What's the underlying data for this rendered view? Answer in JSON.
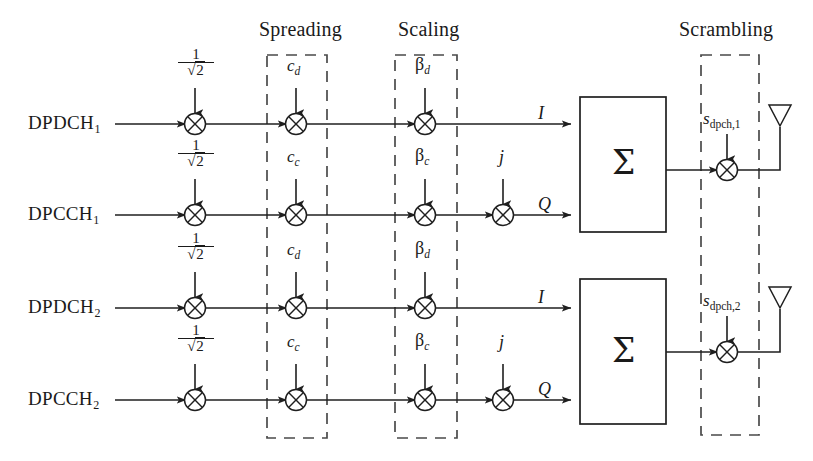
{
  "figure": {
    "line_color": "#1f1f1f",
    "dashed_color": "#4a4a4a",
    "sections": [
      {
        "name": "spreading",
        "label": "Spreading"
      },
      {
        "name": "scaling",
        "label": "Scaling"
      },
      {
        "name": "scrambling",
        "label": "Scrambling"
      }
    ],
    "branches": [
      {
        "input_label": "DPDCH",
        "input_sub": "1",
        "gain_num": "1",
        "gain_den": "2",
        "gain_radical": "√",
        "spread_code": "c",
        "spread_sub": "d",
        "scale_symbol": "β",
        "scale_sub": "d",
        "rail_label": "I",
        "has_j": false,
        "j_label": ""
      },
      {
        "input_label": "DPCCH",
        "input_sub": "1",
        "gain_num": "1",
        "gain_den": "2",
        "gain_radical": "√",
        "spread_code": "c",
        "spread_sub": "c",
        "scale_symbol": "β",
        "scale_sub": "c",
        "rail_label": "Q",
        "has_j": true,
        "j_label": "j"
      },
      {
        "input_label": "DPDCH",
        "input_sub": "2",
        "gain_num": "1",
        "gain_den": "2",
        "gain_radical": "√",
        "spread_code": "c",
        "spread_sub": "d",
        "scale_symbol": "β",
        "scale_sub": "d",
        "rail_label": "I",
        "has_j": false,
        "j_label": ""
      },
      {
        "input_label": "DPCCH",
        "input_sub": "2",
        "gain_num": "1",
        "gain_den": "2",
        "gain_radical": "√",
        "spread_code": "c",
        "spread_sub": "c",
        "scale_symbol": "β",
        "scale_sub": "c",
        "rail_label": "Q",
        "has_j": true,
        "j_label": "j"
      }
    ],
    "summers": [
      {
        "name": "summer-1",
        "symbol": "Σ"
      },
      {
        "name": "summer-2",
        "symbol": "Σ"
      }
    ],
    "scramblers": [
      {
        "name": "scrambler-1",
        "code": "s",
        "sub": "dpch,1"
      },
      {
        "name": "scrambler-2",
        "code": "s",
        "sub": "dpch,2"
      }
    ],
    "antennas": [
      {
        "name": "antenna-1"
      },
      {
        "name": "antenna-2"
      }
    ]
  }
}
